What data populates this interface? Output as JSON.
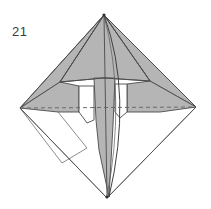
{
  "figure": {
    "step_number": "21",
    "caption": "",
    "kind": "origami-fold-diagram",
    "colors": {
      "paper_front": "#b5b5b5",
      "paper_back": "#ffffff",
      "edge_line": "#4a4a4a",
      "fold_line_hidden": "#6e6e6e",
      "background": "#ffffff",
      "label_text": "#3a3a3a"
    },
    "canvas": {
      "width": 211,
      "height": 209
    },
    "vertices": {
      "apex_top": [
        104,
        15
      ],
      "point_left": [
        20,
        108
      ],
      "point_right": [
        196,
        107
      ],
      "point_bottom": [
        107,
        198
      ],
      "center": [
        104,
        108
      ],
      "shoulder_left": [
        60,
        82
      ],
      "shoulder_right": [
        150,
        81
      ],
      "notch_left_outer": [
        79,
        86
      ],
      "notch_left_inner": [
        87,
        122
      ],
      "notch_right_outer": [
        127,
        84
      ],
      "notch_right_inner": [
        122,
        120
      ]
    },
    "lines": {
      "hidden_horizontal_dashed": {
        "from": [
          20,
          108
        ],
        "to": [
          196,
          107
        ],
        "style": "dashed"
      },
      "curved_edge": {
        "from": [
          104,
          15
        ],
        "to": [
          109,
          197
        ],
        "style": "curve",
        "bulge": "right"
      }
    },
    "regions": [
      {
        "name": "upper-left-gray-wing",
        "fill": "paper_front"
      },
      {
        "name": "upper-right-gray-wing",
        "fill": "paper_front"
      },
      {
        "name": "central-gray-spine",
        "fill": "paper_front"
      },
      {
        "name": "lower-left-white-flap",
        "fill": "paper_back"
      },
      {
        "name": "lower-right-white-flap",
        "fill": "paper_back"
      },
      {
        "name": "left-white-notch",
        "fill": "paper_back"
      },
      {
        "name": "right-white-notch",
        "fill": "paper_back"
      }
    ]
  }
}
